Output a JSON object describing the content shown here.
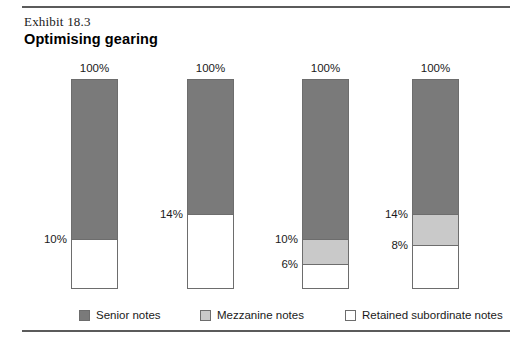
{
  "figure": {
    "exhibit_label": "Exhibit 18.3",
    "title": "Optimising gearing"
  },
  "legend": {
    "items": [
      {
        "label": "Senior notes",
        "color": "#7a7a7a",
        "swatch": "senior",
        "left": 79
      },
      {
        "label": "Mezzanine notes",
        "color": "#c9c9c9",
        "swatch": "mezzanine",
        "left": 200
      },
      {
        "label": "Retained subordinate notes",
        "color": "#ffffff",
        "swatch": "retained",
        "left": 345
      }
    ]
  },
  "chart_data": {
    "type": "bar",
    "title": "Optimising gearing",
    "subtitle": "Exhibit 18.3",
    "xlabel": "",
    "ylabel": "",
    "ylim": [
      0,
      100
    ],
    "grid": false,
    "legend_position": "bottom",
    "stacked": true,
    "categories": [
      "Structure 1",
      "Structure 2",
      "Structure 3",
      "Structure 4"
    ],
    "series": [
      {
        "name": "Senior notes",
        "color": "#7a7a7a",
        "values": [
          90,
          86,
          90,
          86
        ]
      },
      {
        "name": "Mezzanine notes",
        "color": "#c9c9c9",
        "values": [
          0,
          0,
          4,
          6
        ]
      },
      {
        "name": "Retained subordinate notes",
        "color": "#ffffff",
        "values": [
          10,
          14,
          6,
          8
        ]
      }
    ],
    "bars": [
      {
        "top_label": "100%",
        "left_px": 71,
        "width_px": 47,
        "segments": [
          {
            "name": "Senior notes",
            "fill": "senior",
            "height_pct": 76.4,
            "boundary_label": "10%"
          },
          {
            "name": "Retained subordinate notes",
            "fill": "retained",
            "height_pct": 23.6,
            "boundary_label": ""
          }
        ]
      },
      {
        "top_label": "100%",
        "left_px": 187,
        "width_px": 47,
        "segments": [
          {
            "name": "Senior notes",
            "fill": "senior",
            "height_pct": 64.3,
            "boundary_label": "14%"
          },
          {
            "name": "Retained subordinate notes",
            "fill": "retained",
            "height_pct": 35.7,
            "boundary_label": ""
          }
        ]
      },
      {
        "top_label": "100%",
        "left_px": 302,
        "width_px": 47,
        "segments": [
          {
            "name": "Senior notes",
            "fill": "senior",
            "height_pct": 76.4,
            "boundary_label": "10%"
          },
          {
            "name": "Mezzanine notes",
            "fill": "mezzanine",
            "height_pct": 11.9,
            "boundary_label": "6%"
          },
          {
            "name": "Retained subordinate notes",
            "fill": "retained",
            "height_pct": 11.7,
            "boundary_label": ""
          }
        ]
      },
      {
        "top_label": "100%",
        "left_px": 412,
        "width_px": 47,
        "segments": [
          {
            "name": "Senior notes",
            "fill": "senior",
            "height_pct": 64.3,
            "boundary_label": "14%"
          },
          {
            "name": "Mezzanine notes",
            "fill": "mezzanine",
            "height_pct": 14.8,
            "boundary_label": "8%"
          },
          {
            "name": "Retained subordinate notes",
            "fill": "retained",
            "height_pct": 20.9,
            "boundary_label": ""
          }
        ]
      }
    ]
  }
}
